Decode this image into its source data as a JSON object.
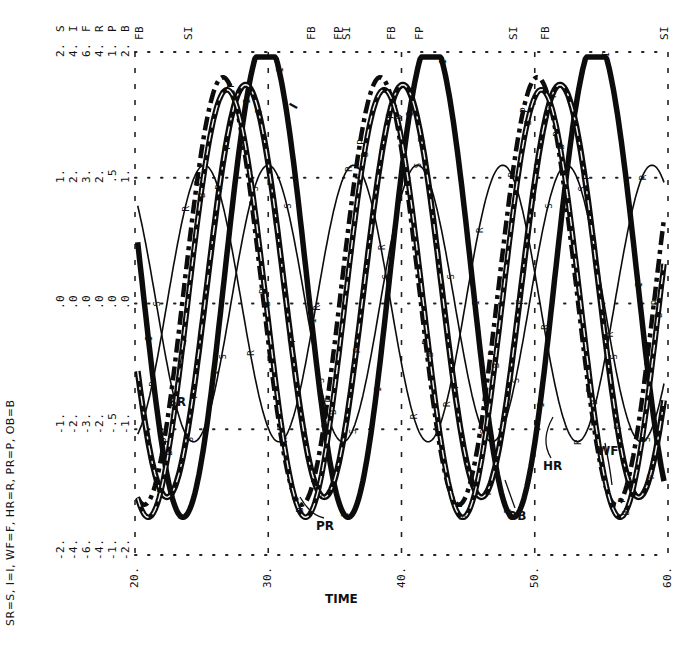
{
  "chart_data": {
    "type": "line",
    "title": "",
    "xlabel": "TIME",
    "ylabel": "",
    "orientation": "rotated (plotter output; value axes along top edge, time along bottom)",
    "xlim": [
      20,
      60
    ],
    "x_ticks": [
      "20.",
      "30.",
      "40.",
      "50.",
      "60."
    ],
    "legend_text": "SR=S, I=I, WF=F, HR=R, PR=P, OB=B",
    "legend_position": "left, rotated",
    "scales": {
      "variables": [
        "S",
        "I",
        "F",
        "R",
        "P",
        "B"
      ],
      "gridline_values": [
        [
          "-2.",
          "-4.",
          "-6.",
          "-4.",
          "-1.",
          "-2."
        ],
        [
          "-1.",
          "-2.",
          "-3.",
          "-2.",
          "-.5",
          "-1."
        ],
        [
          ".0",
          ".0",
          ".0",
          ".0",
          ".0",
          ".0"
        ],
        [
          "1.",
          "2.",
          "3.",
          "2.",
          ".5",
          "1."
        ],
        [
          "2.",
          "4.",
          "6.",
          "4.",
          "1.",
          "2."
        ]
      ]
    },
    "top_annotations": [
      {
        "text": "FB",
        "time": 20.3
      },
      {
        "text": "SI",
        "time": 24.0
      },
      {
        "text": "FB",
        "time": 33.2
      },
      {
        "text": "FP",
        "time": 35.2
      },
      {
        "text": "SI",
        "time": 35.8
      },
      {
        "text": "FB",
        "time": 39.2
      },
      {
        "text": "FP",
        "time": 41.3
      },
      {
        "text": "SI",
        "time": 48.4
      },
      {
        "text": "FB",
        "time": 50.8
      },
      {
        "text": "SI",
        "time": 59.7
      }
    ],
    "curve_labels": [
      "I",
      "SR",
      "PR",
      "OB",
      "HR",
      "WF"
    ],
    "grid": true,
    "series": [
      {
        "name": "I",
        "marker": "I",
        "style": "thick solid",
        "period": 12.4,
        "amplitude_norm": 0.95,
        "peak_times": [
          29.8,
          42.1,
          54.2
        ],
        "offset_norm": 0.1
      },
      {
        "name": "HR (R)",
        "marker": "R",
        "style": "thin solid",
        "period": 11.2,
        "amplitude_norm": 0.55,
        "peak_times": [
          25.2,
          36.0,
          47.0,
          58.0
        ],
        "offset_norm": 0.0
      },
      {
        "name": "SR (S)",
        "marker": "S",
        "style": "thin solid",
        "period": 11.2,
        "amplitude_norm": 0.55,
        "peak_times": [
          30.0,
          41.0,
          52.0
        ],
        "offset_norm": 0.0
      },
      {
        "name": "WF (F)",
        "marker": "F",
        "style": "thick dash-dot",
        "period": 11.8,
        "amplitude_norm": 0.82,
        "peak_times": [
          28.3,
          40.0,
          51.8
        ],
        "offset_norm": 0.05
      },
      {
        "name": "PR (P)",
        "marker": "P",
        "style": "dash-dot",
        "period": 11.8,
        "amplitude_norm": 0.85,
        "peak_times": [
          26.6,
          38.3,
          50.0
        ],
        "offset_norm": 0.05
      },
      {
        "name": "OB (B)",
        "marker": "B",
        "style": "thick dashed",
        "period": 11.8,
        "amplitude_norm": 0.85,
        "peak_times": [
          26.9,
          38.6,
          50.3
        ],
        "offset_norm": 0.0
      }
    ]
  }
}
